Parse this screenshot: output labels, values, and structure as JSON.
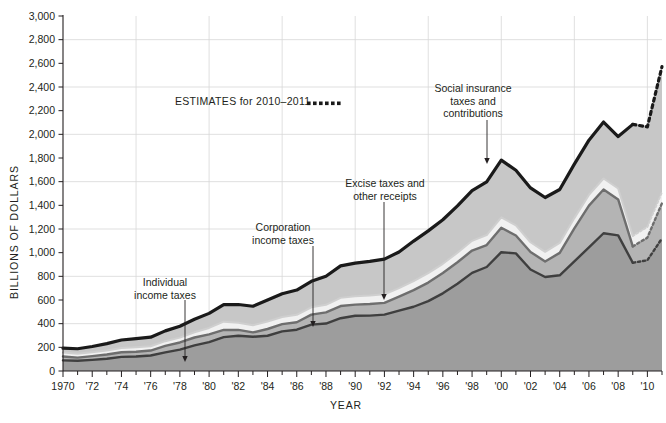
{
  "chart_data": {
    "type": "area",
    "title": "",
    "xlabel": "YEAR",
    "ylabel": "BILLIONS OF DOLLARS",
    "xlim": [
      1970,
      2011
    ],
    "ylim": [
      0,
      3000
    ],
    "ytick_step": 200,
    "gridline_step": 400,
    "grid": true,
    "stacked": true,
    "estimate_start_year": 2009,
    "x": [
      1970,
      1971,
      1972,
      1973,
      1974,
      1975,
      1976,
      1977,
      1978,
      1979,
      1980,
      1981,
      1982,
      1983,
      1984,
      1985,
      1986,
      1987,
      1988,
      1989,
      1990,
      1991,
      1992,
      1993,
      1994,
      1995,
      1996,
      1997,
      1998,
      1999,
      2000,
      2001,
      2002,
      2003,
      2004,
      2005,
      2006,
      2007,
      2008,
      2009,
      2010,
      2011
    ],
    "ytick_labels": [
      "0",
      "200",
      "400",
      "600",
      "800",
      "1,000",
      "1,200",
      "1,400",
      "1,600",
      "1,800",
      "2,000",
      "2,200",
      "2,400",
      "2,600",
      "2,800",
      "3,000"
    ],
    "xtick_labels": [
      "1970",
      "'72",
      "'74",
      "'76",
      "'78",
      "'80",
      "'82",
      "'84",
      "'86",
      "'88",
      "'90",
      "'92",
      "'94",
      "'96",
      "'98",
      "'00",
      "'02",
      "'04",
      "'06",
      "'08",
      "'10"
    ],
    "series": [
      {
        "name": "Individual income taxes",
        "fill": "#9d9d9d",
        "stroke": "#3f3f3f",
        "values": [
          90,
          86,
          94,
          103,
          119,
          122,
          131,
          157,
          181,
          217,
          244,
          286,
          298,
          289,
          298,
          335,
          349,
          392,
          401,
          446,
          467,
          468,
          476,
          510,
          543,
          590,
          656,
          737,
          829,
          879,
          1004,
          994,
          858,
          794,
          809,
          927,
          1044,
          1164,
          1146,
          915,
          936,
          1121
        ]
      },
      {
        "name": "Corporation income taxes",
        "fill": "#b4b4b4",
        "stroke": "#6e6e6e",
        "values": [
          33,
          27,
          32,
          36,
          39,
          41,
          42,
          55,
          60,
          66,
          65,
          61,
          49,
          37,
          57,
          61,
          63,
          84,
          95,
          103,
          94,
          98,
          100,
          118,
          140,
          157,
          172,
          182,
          189,
          185,
          207,
          151,
          148,
          132,
          189,
          278,
          354,
          370,
          304,
          138,
          191,
          297
        ]
      },
      {
        "name": "Excise taxes and other receipts",
        "fill": "#f1f1f1",
        "stroke": "#cfcfcf",
        "values": [
          33,
          32,
          33,
          35,
          37,
          38,
          36,
          40,
          41,
          44,
          55,
          70,
          60,
          60,
          63,
          60,
          63,
          62,
          63,
          69,
          70,
          71,
          72,
          73,
          77,
          80,
          78,
          80,
          82,
          85,
          88,
          85,
          82,
          81,
          84,
          87,
          90,
          93,
          92,
          88,
          91,
          95
        ]
      },
      {
        "name": "Social insurance taxes and contributions",
        "fill": "#c7c7c7",
        "stroke": "#1a1a1a",
        "values": [
          37,
          43,
          48,
          57,
          67,
          72,
          77,
          87,
          96,
          110,
          123,
          144,
          155,
          161,
          182,
          197,
          209,
          220,
          242,
          270,
          281,
          289,
          297,
          305,
          338,
          357,
          372,
          396,
          424,
          449,
          483,
          466,
          459,
          459,
          452,
          456,
          463,
          477,
          439,
          943,
          845,
          1060
        ]
      }
    ],
    "totals": [
      193,
      188,
      207,
      231,
      262,
      273,
      286,
      339,
      378,
      437,
      487,
      561,
      562,
      547,
      600,
      653,
      684,
      758,
      801,
      888,
      912,
      926,
      945,
      1006,
      1098,
      1184,
      1278,
      1395,
      1524,
      1598,
      1782,
      1696,
      1547,
      1466,
      1534,
      1748,
      1951,
      2104,
      1981,
      2084,
      2063,
      2573
    ],
    "annotations": [
      {
        "id": "individual-income-taxes",
        "text": [
          "Individual",
          "income taxes"
        ],
        "x_label": 165,
        "y_label": 286,
        "arrow_x": 185,
        "arrow_y1": 300,
        "arrow_y2": 362
      },
      {
        "id": "corporation-income-taxes",
        "text": [
          "Corporation",
          "income taxes"
        ],
        "x_label": 283,
        "y_label": 231,
        "arrow_x": 313,
        "arrow_y1": 246,
        "arrow_y2": 327
      },
      {
        "id": "excise-taxes-and-other-receipts",
        "text": [
          "Excise taxes and",
          "other receipts"
        ],
        "x_label": 385,
        "y_label": 187,
        "arrow_x": 384,
        "arrow_y1": 202,
        "arrow_y2": 300
      },
      {
        "id": "social-insurance-taxes-and-contributions",
        "text": [
          "Social insurance",
          "taxes and",
          "contributions"
        ],
        "x_label": 473,
        "y_label": 92,
        "arrow_x": 487,
        "arrow_y1": 120,
        "arrow_y2": 164
      }
    ],
    "legend": {
      "text": "ESTIMATES for 2010–2011",
      "position": "inside-top-left",
      "swatch": "dotted-line",
      "swatch_color": "#1a1a1a"
    }
  }
}
